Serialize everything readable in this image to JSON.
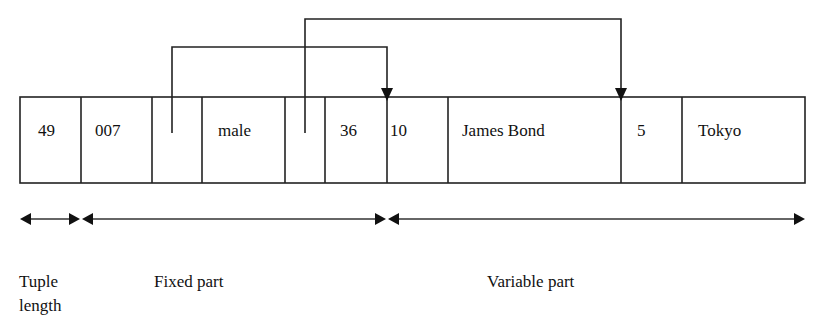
{
  "tuple": {
    "cells": [
      {
        "value": "49",
        "x": 20,
        "w": 61,
        "tx": 18
      },
      {
        "value": "007",
        "x": 81,
        "w": 71,
        "tx": 14
      },
      {
        "value": "",
        "x": 152,
        "w": 50,
        "tx": 0
      },
      {
        "value": "male",
        "x": 202,
        "w": 83,
        "tx": 16
      },
      {
        "value": "",
        "x": 285,
        "w": 40,
        "tx": 0
      },
      {
        "value": "36",
        "x": 325,
        "w": 62,
        "tx": 15
      },
      {
        "value": "10",
        "x": 387,
        "w": 61,
        "tx": 3
      },
      {
        "value": "James Bond",
        "x": 448,
        "w": 173,
        "tx": 14
      },
      {
        "value": "5",
        "x": 621,
        "w": 61,
        "tx": 16
      },
      {
        "value": "Tokyo",
        "x": 682,
        "w": 123,
        "tx": 16
      }
    ]
  },
  "pointers": [
    {
      "from": "offset-1",
      "to": "10"
    },
    {
      "from": "offset-2",
      "to": "5"
    }
  ],
  "regions": {
    "tuple_length": {
      "line1": "Tuple",
      "line2": "length"
    },
    "fixed_part": "Fixed part",
    "variable_part": "Variable part"
  }
}
